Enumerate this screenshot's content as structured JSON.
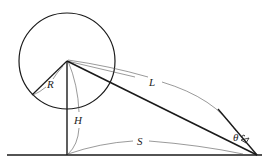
{
  "diagram": {
    "type": "geometry",
    "labels": {
      "radius": "R",
      "height": "H",
      "length": "L",
      "distance": "S",
      "angle": "θ"
    },
    "colors": {
      "stroke": "#1a1a1a",
      "thin_stroke": "#555555",
      "background": "#ffffff"
    }
  }
}
